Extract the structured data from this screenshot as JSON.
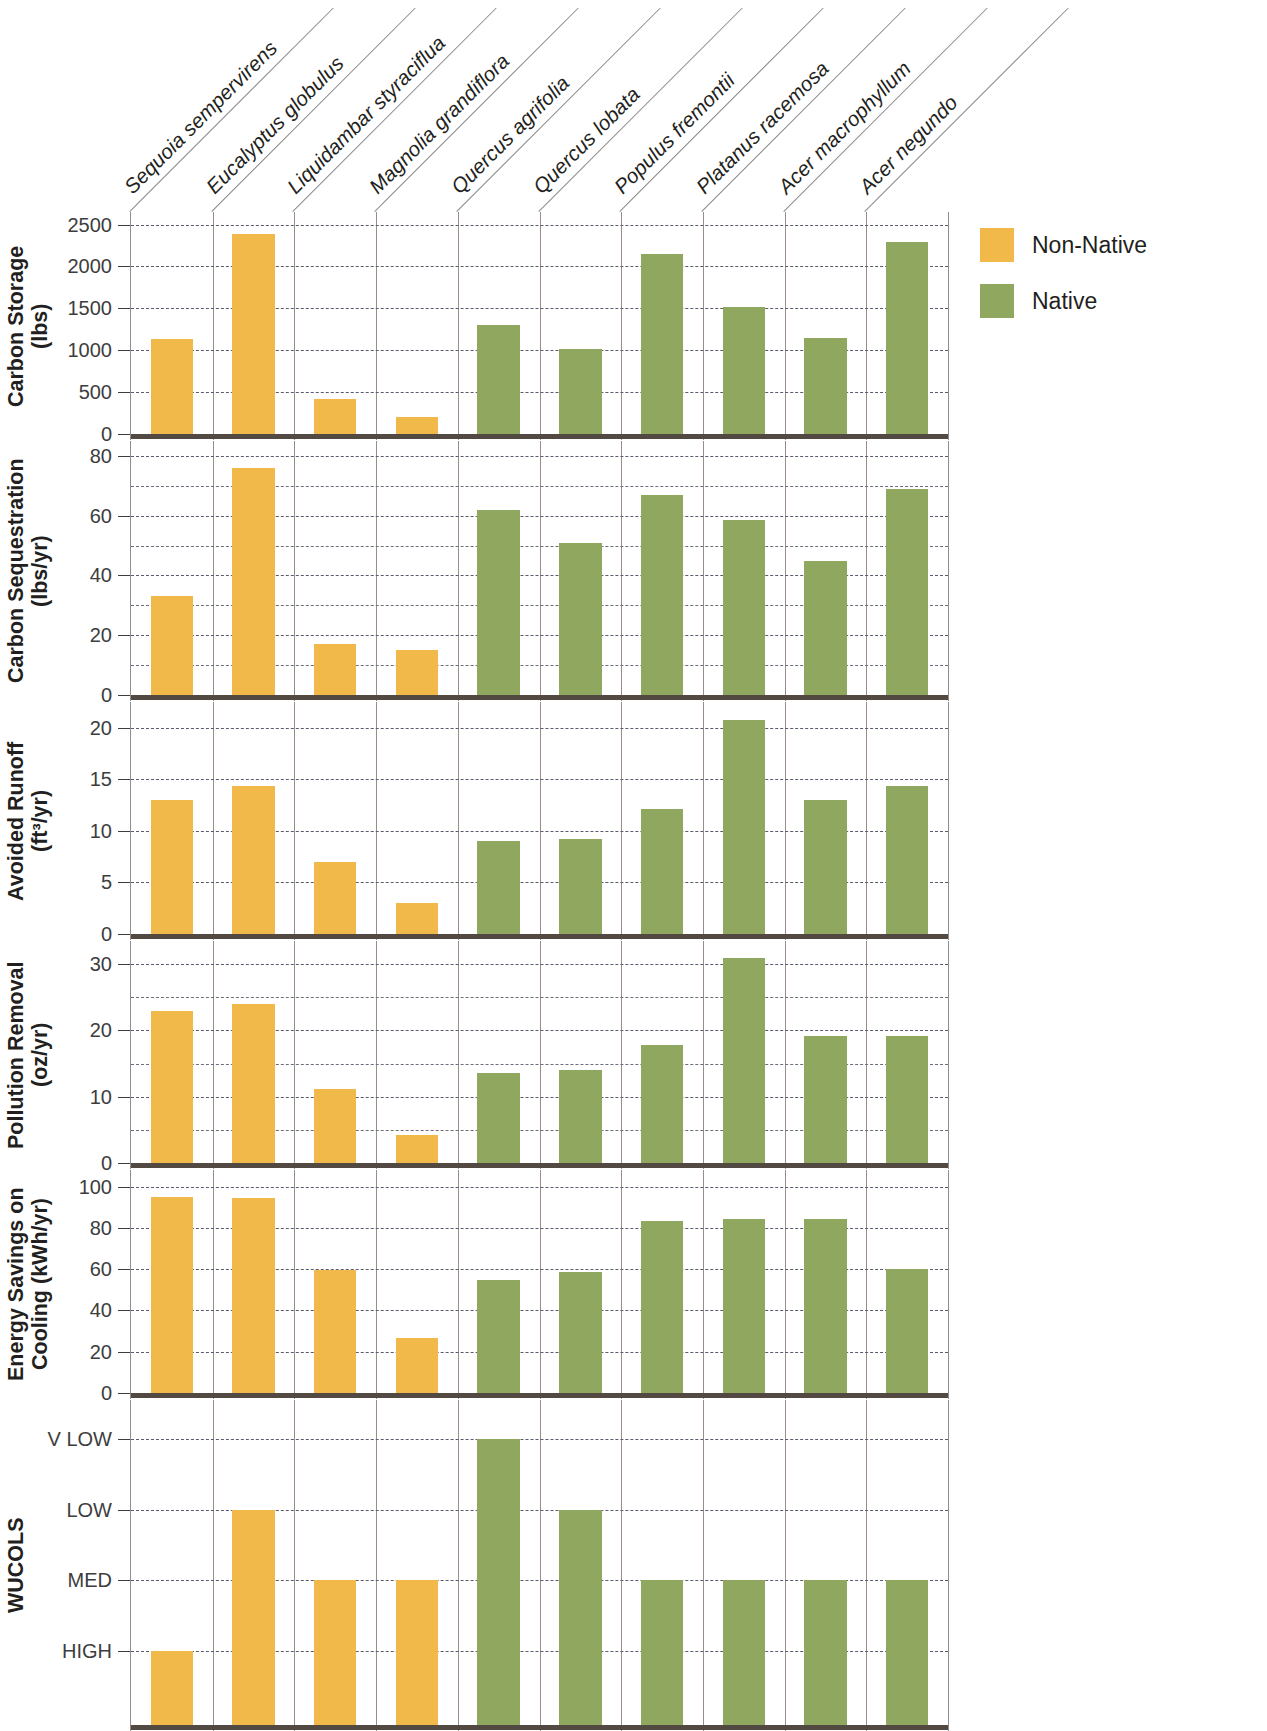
{
  "legend": {
    "items": [
      {
        "label": "Non-Native",
        "color": "#f1b94a"
      },
      {
        "label": "Native",
        "color": "#90a760"
      }
    ]
  },
  "chart_data": {
    "type": "bar",
    "title": "",
    "xlabel": "",
    "grid": true,
    "legend_position": "right",
    "categories": [
      "Sequoia sempervirens",
      "Eucalyptus globulus",
      "Liquidambar styraciflua",
      "Magnolia grandiflora",
      "Quercus agrifolia",
      "Quercus lobata",
      "Populus fremontii",
      "Platanus racemosa",
      "Acer macrophyllum",
      "Acer negundo"
    ],
    "category_groups": [
      "Non-Native",
      "Non-Native",
      "Non-Native",
      "Non-Native",
      "Native",
      "Native",
      "Native",
      "Native",
      "Native",
      "Native"
    ],
    "panels": [
      {
        "ylabel": "Carbon Storage\n(lbs)",
        "ylabel_line1": "Carbon Storage",
        "ylabel_line2": "(lbs)",
        "unit": "lbs",
        "ylim": [
          0,
          2650
        ],
        "ticks": [
          0,
          500,
          1000,
          1500,
          2000,
          2500
        ],
        "tick_labels": [
          "0",
          "500",
          "1000",
          "1500",
          "2000",
          "2500"
        ],
        "values": [
          1140,
          2390,
          420,
          205,
          1300,
          1010,
          2150,
          1520,
          1150,
          2290
        ]
      },
      {
        "ylabel_line1": "Carbon Sequestration",
        "ylabel_line2": "(lbs/yr)",
        "unit": "lbs/yr",
        "ylim": [
          0,
          85
        ],
        "ticks": [
          0,
          20,
          40,
          60,
          80
        ],
        "tick_labels": [
          "0",
          "20",
          "40",
          "60",
          "80"
        ],
        "minor_ticks": [
          10,
          30,
          50,
          70
        ],
        "values": [
          33,
          76,
          17,
          15,
          62,
          51,
          67,
          58.5,
          45,
          69
        ]
      },
      {
        "ylabel_line1": "Avoided Runoff",
        "ylabel_line2": "(ft³/yr)",
        "unit": "ft3/yr",
        "ylim": [
          0,
          22.5
        ],
        "ticks": [
          0,
          5,
          10,
          15,
          20
        ],
        "tick_labels": [
          "0",
          "5",
          "10",
          "15",
          "20"
        ],
        "values": [
          13,
          14.4,
          7,
          3,
          9,
          9.2,
          12.1,
          20.8,
          13,
          14.4
        ]
      },
      {
        "ylabel_line1": "Pollution Removal",
        "ylabel_line2": "(oz/yr)",
        "unit": "oz/yr",
        "ylim": [
          0,
          33.5
        ],
        "ticks": [
          0,
          10,
          20,
          30
        ],
        "tick_labels": [
          "0",
          "10",
          "20",
          "30"
        ],
        "minor_ticks": [
          5,
          15,
          25
        ],
        "values": [
          23,
          24,
          11.2,
          4.2,
          13.6,
          14,
          17.8,
          31,
          19.1,
          19.1
        ]
      },
      {
        "ylabel_line1": "Energy Savings on",
        "ylabel_line2": "Cooling (kWh/yr)",
        "unit": "kWh/yr",
        "ylim": [
          0,
          108
        ],
        "ticks": [
          0,
          20,
          40,
          60,
          80,
          100
        ],
        "tick_labels": [
          "0",
          "20",
          "40",
          "60",
          "80",
          "100"
        ],
        "values": [
          95,
          94.5,
          59.5,
          26.5,
          54.5,
          58.5,
          83.5,
          84.5,
          84.5,
          60
        ]
      },
      {
        "ylabel_line1": "WUCOLS",
        "ylabel_line2": "",
        "unit": "category",
        "categorical": true,
        "tick_labels": [
          "V LOW",
          "LOW",
          "MED",
          "HIGH"
        ],
        "values": [
          "HIGH",
          "LOW",
          "MED",
          "MED",
          "V LOW",
          "LOW",
          "MED",
          "MED",
          "MED",
          "MED"
        ]
      }
    ]
  }
}
